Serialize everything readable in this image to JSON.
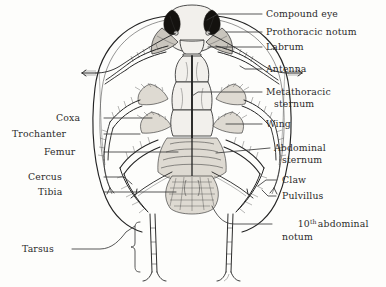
{
  "figure": {
    "view": "ventral",
    "background_color": "#fdfdfb",
    "ink_color": "#232323",
    "text_color": "#2b2b2b"
  },
  "labels": {
    "compound_eye": "Compound eye",
    "prothoracic_notum": "Prothoracic notum",
    "labrum": "Labrum",
    "antenna": "Antenna",
    "metathoracic_sternum_line1": "Metathoracic",
    "metathoracic_sternum_line2": "sternum",
    "wing": "Wing",
    "abdominal_sternum_line1": "Abdominal",
    "abdominal_sternum_line2": "sternum",
    "claw": "Claw",
    "pulvillus": "Pulvillus",
    "tenth_abdominal_notum_num": "10",
    "tenth_abdominal_notum_sup": "th",
    "tenth_abdominal_notum_rest": "abdominal",
    "tenth_abdominal_notum_line2": "notum",
    "coxa": "Coxa",
    "trochanter": "Trochanter",
    "femur": "Femur",
    "cercus": "Cercus",
    "tibia": "Tibia",
    "tarsus": "Tarsus"
  },
  "parts": {
    "head": "head",
    "left_compound_eye": "left compound eye",
    "right_compound_eye": "right compound eye",
    "left_antenna": "left antenna",
    "right_antenna": "right antenna",
    "thorax": "thorax",
    "abdomen": "abdomen",
    "wing_outline": "wing outline",
    "legs": "legs",
    "cerci": "cerci",
    "tarsus_brace": "tarsus brace"
  }
}
